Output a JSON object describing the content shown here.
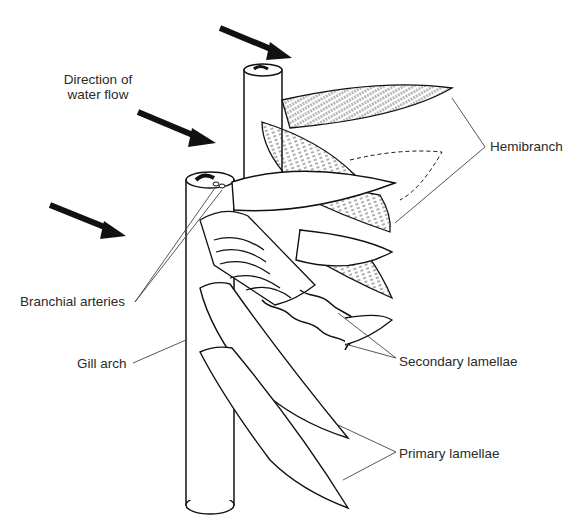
{
  "figure": {
    "labels": {
      "direction_line1": "Direction of",
      "direction_line2": "water flow",
      "hemibranch": "Hemibranch",
      "branchial_arteries": "Branchial arteries",
      "gill_arch": "Gill arch",
      "secondary_lamellae": "Secondary lamellae",
      "primary_lamellae": "Primary lamellae"
    },
    "arrow_count": 3,
    "colors": {
      "ink": "#111111",
      "label": "#2a2a2a",
      "leader": "#444444",
      "background": "#ffffff"
    }
  }
}
